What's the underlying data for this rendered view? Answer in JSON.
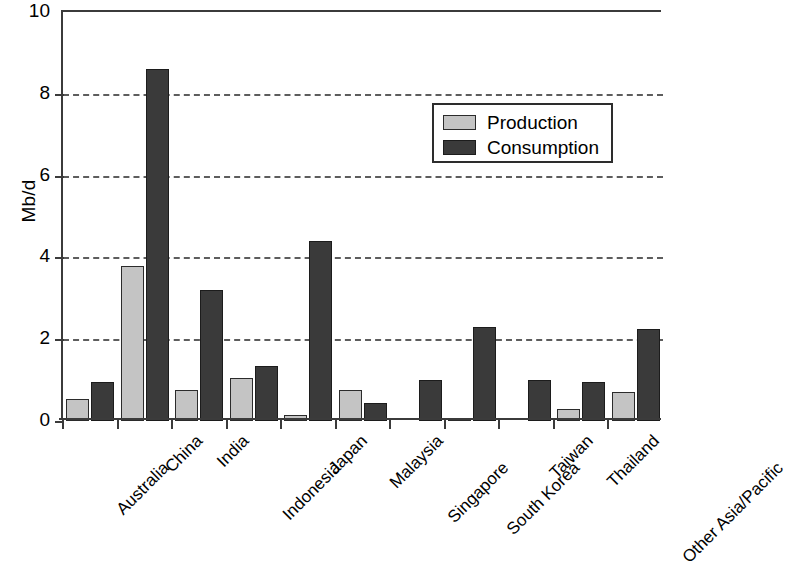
{
  "chart_data": {
    "type": "bar",
    "title": "",
    "xlabel": "",
    "ylabel": "Mb/d",
    "ylim": [
      0,
      10
    ],
    "yticks": [
      0,
      2,
      4,
      6,
      8,
      10
    ],
    "ytick_labels": [
      "0",
      "2",
      "4",
      "6",
      "8",
      "10"
    ],
    "grid": "horizontal-dashed",
    "legend_position": "upper-right-inside",
    "categories": [
      "Australia",
      "China",
      "India",
      "Indonesia",
      "Japan",
      "Malaysia",
      "Singapore",
      "South Korea",
      "Taiwan",
      "Thailand",
      "Other Asia/Pacific"
    ],
    "series": [
      {
        "name": "Production",
        "color": "#c4c4c4",
        "values": [
          0.55,
          3.8,
          0.75,
          1.05,
          0.15,
          0.75,
          0.0,
          0.05,
          0.0,
          0.3,
          0.7
        ]
      },
      {
        "name": "Consumption",
        "color": "#3a3a3a",
        "values": [
          0.95,
          8.6,
          3.2,
          1.35,
          4.4,
          0.45,
          1.0,
          2.3,
          1.0,
          0.95,
          2.25
        ]
      }
    ]
  },
  "axes": {
    "ylabel": "Mb/d"
  },
  "legend": {
    "items": [
      {
        "label": "Production",
        "color": "#c4c4c4"
      },
      {
        "label": "Consumption",
        "color": "#3a3a3a"
      }
    ]
  }
}
